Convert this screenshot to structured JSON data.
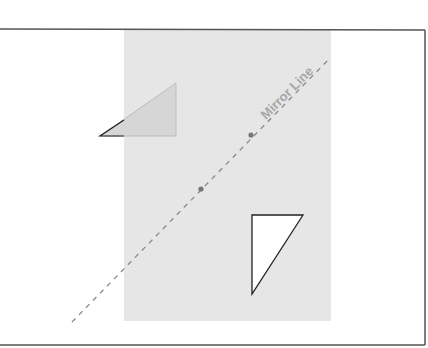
{
  "diagram": {
    "mirror_line": {
      "label": "Mirror Line",
      "start": [
        72,
        322
      ],
      "end": [
        330,
        58
      ],
      "color": "#8a8a8a",
      "dash": "5,5",
      "points": [
        [
          251,
          135
        ],
        [
          201,
          189
        ]
      ]
    },
    "grid_region": {
      "x": 124,
      "y": 30,
      "width": 207,
      "height": 291,
      "color": "#e6e6e6"
    },
    "frame": {
      "top_y": 29,
      "bottom_y": 345,
      "right_x": 425,
      "color": "#555555"
    },
    "shapes": [
      {
        "name": "original-triangle",
        "points": "100,136 176,83 176,136",
        "fill": "#d4d4d4",
        "stroke": "#222222"
      },
      {
        "name": "reflected-triangle",
        "points": "252,215 303,215 252,294",
        "fill": "#ffffff",
        "stroke": "#222222"
      }
    ]
  }
}
